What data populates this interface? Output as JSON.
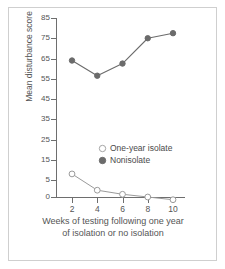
{
  "chart_data": {
    "type": "line",
    "title": "",
    "xlabel": "Weeks of testing following one year of isolation or no isolation",
    "ylabel": "Mean disturbance score",
    "x": [
      2,
      4,
      6,
      8,
      10
    ],
    "xtick_labels": [
      "2",
      "4",
      "6",
      "8",
      "10"
    ],
    "ytick_labels": [
      "0",
      "5",
      "15",
      "25",
      "35",
      "45",
      "55",
      "65",
      "75",
      "85"
    ],
    "ytick_values": [
      0,
      5,
      15,
      25,
      35,
      45,
      55,
      65,
      75,
      85
    ],
    "ylim": [
      -2,
      85
    ],
    "xlim": [
      1,
      11
    ],
    "grid": false,
    "legend_position": "center-right-inside",
    "series": [
      {
        "name": "One-year isolate",
        "marker": "open-circle",
        "color": "#8a8a8a",
        "values": [
          8,
          2,
          0.8,
          0,
          -0.8
        ]
      },
      {
        "name": "Nonisolate",
        "marker": "filled-circle",
        "color": "#6b6b6b",
        "values": [
          64,
          56.5,
          62.5,
          75,
          77.5
        ]
      }
    ]
  },
  "axis": {
    "xlabel_line1": "Weeks of testing following one year",
    "xlabel_line2": "of isolation or no isolation",
    "ylabel": "Mean disturbance score"
  },
  "legend": {
    "items": [
      {
        "label": "One-year isolate",
        "marker": "open-circle"
      },
      {
        "label": "Nonisolate",
        "marker": "filled-circle"
      }
    ]
  },
  "colors": {
    "axis": "#6e6e6e",
    "text": "#555555",
    "isolate_line": "#9a9a9a",
    "isolate_marker_stroke": "#9a9a9a",
    "nonisolate_line": "#6b6b6b",
    "nonisolate_marker": "#6b6b6b",
    "frame": "#cfcfcf",
    "background": "#ffffff"
  }
}
